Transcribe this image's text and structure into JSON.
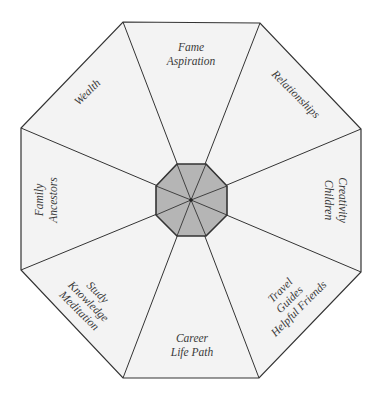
{
  "diagram": {
    "type": "bagua-octagon",
    "colors": {
      "background": "#ffffff",
      "outer_fill": "#f3f3f3",
      "center_fill": "#b5b5b5",
      "stroke": "#333333",
      "text": "#3a3a3a"
    },
    "center": [
      191,
      200
    ],
    "outer_vertices": [
      [
        123,
        22
      ],
      [
        260,
        23
      ],
      [
        361,
        129
      ],
      [
        361,
        272
      ],
      [
        259,
        378
      ],
      [
        123,
        378
      ],
      [
        21,
        270
      ],
      [
        21,
        128
      ]
    ],
    "inner_vertices": [
      [
        177,
        164
      ],
      [
        206,
        164
      ],
      [
        227,
        186
      ],
      [
        227,
        215
      ],
      [
        206,
        236
      ],
      [
        177,
        236
      ],
      [
        156,
        215
      ],
      [
        156,
        186
      ]
    ],
    "sections": [
      {
        "id": "fame",
        "lines": [
          "Fame",
          "Aspiration"
        ]
      },
      {
        "id": "relationships",
        "lines": [
          "Relationships"
        ]
      },
      {
        "id": "creativity",
        "lines": [
          "Creativity",
          "Children"
        ]
      },
      {
        "id": "travel",
        "lines": [
          "Travel",
          "Guides",
          "Helpful Friends"
        ]
      },
      {
        "id": "career",
        "lines": [
          "Career",
          "Life Path"
        ]
      },
      {
        "id": "knowledge",
        "lines": [
          "Study",
          "Knowledge",
          "Meditation"
        ]
      },
      {
        "id": "family",
        "lines": [
          "Family",
          "Ancestors"
        ]
      },
      {
        "id": "wealth",
        "lines": [
          "Wealth"
        ]
      }
    ]
  }
}
